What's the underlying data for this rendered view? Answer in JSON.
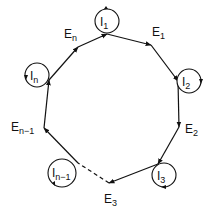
{
  "diagram": {
    "type": "cyclic-graph",
    "vertices": [
      {
        "id": "I1",
        "label": "I",
        "sub": "1"
      },
      {
        "id": "I2",
        "label": "I",
        "sub": "2"
      },
      {
        "id": "I3",
        "label": "I",
        "sub": "3"
      },
      {
        "id": "In-1",
        "label": "I",
        "sub": "n−1"
      },
      {
        "id": "In",
        "label": "I",
        "sub": "n"
      }
    ],
    "edges": [
      {
        "id": "E1",
        "label": "E",
        "sub": "1",
        "from": "I1",
        "to": "I2"
      },
      {
        "id": "E2",
        "label": "E",
        "sub": "2",
        "from": "I2",
        "to": "I3"
      },
      {
        "id": "E3",
        "label": "E",
        "sub": "3",
        "from": "I3",
        "to": "In-1",
        "dashed_part": true
      },
      {
        "id": "En-1",
        "label": "E",
        "sub": "n−1",
        "from": "In-1",
        "to": "In"
      },
      {
        "id": "En",
        "label": "E",
        "sub": "n",
        "from": "In",
        "to": "I1"
      }
    ]
  }
}
